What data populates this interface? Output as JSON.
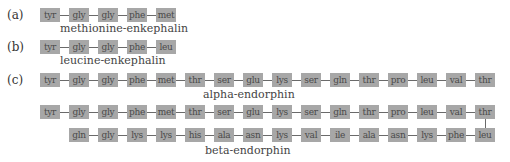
{
  "panels": [
    {
      "label": "(a)",
      "rows": [
        [
          "tyr",
          "gly",
          "gly",
          "phe",
          "met"
        ]
      ],
      "caption": "methionine-enkephalin"
    },
    {
      "label": "(b)",
      "rows": [
        [
          "tyr",
          "gly",
          "gly",
          "phe",
          "leu"
        ]
      ],
      "caption": "leucine-enkephalin"
    },
    {
      "label": "(c)",
      "sequences": [
        {
          "caption": "alpha-endorphin",
          "rows": [
            [
              "tyr",
              "gly",
              "gly",
              "phe",
              "met",
              "thr",
              "ser",
              "glu",
              "lys",
              "ser",
              "gln",
              "thr",
              "pro",
              "leu",
              "val",
              "thr"
            ]
          ]
        },
        {
          "caption": "beta-endorphin",
          "rows": [
            [
              "tyr",
              "gly",
              "gly",
              "phe",
              "met",
              "thr",
              "ser",
              "glu",
              "lys",
              "ser",
              "gln",
              "thr",
              "pro",
              "leu",
              "val",
              "thr"
            ],
            [
              "gln",
              "gly",
              "lys",
              "lys",
              "his",
              "ala",
              "asn",
              "lys",
              "val",
              "ile",
              "ala",
              "asn",
              "lys",
              "phe",
              "leu"
            ]
          ]
        }
      ]
    }
  ],
  "colors": {
    "box": "#a7a7a7",
    "box_text": "#4a4a4a",
    "connector": "#6a6a6a"
  }
}
